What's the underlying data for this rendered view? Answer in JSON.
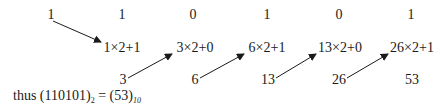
{
  "diagram": {
    "binary_digits": [
      "1",
      "1",
      "0",
      "1",
      "0",
      "1"
    ],
    "expressions": [
      "1×2+1",
      "3×2+0",
      "6×2+1",
      "13×2+0",
      "26×2+1"
    ],
    "results": [
      "3",
      "6",
      "13",
      "26",
      "53"
    ],
    "conclusion": {
      "prefix": "thus ",
      "binary": "(110101)",
      "binary_base": "2",
      "equals": " = ",
      "decimal": "(53)",
      "decimal_base": "10"
    },
    "arrow_color": "#1a1a1a"
  }
}
